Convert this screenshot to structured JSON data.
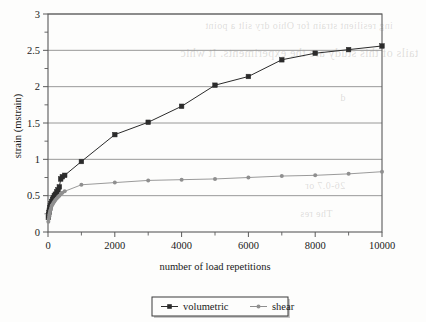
{
  "figure": {
    "background_color": "#fdfdfc",
    "frame_color": "#5a5a5a",
    "grid_color": "#8d8d8d"
  },
  "bleed_through_artifact": {
    "visible": true,
    "lines": [
      "ing resilient strain for Ohio dry silt a point",
      "tails of this study are the experiments. It whic",
      "d",
      "26-0.7 or",
      "The res"
    ]
  },
  "chart_data": {
    "type": "line",
    "title": "",
    "subtitle": "",
    "xlabel": "number of load repetitions",
    "ylabel": "strain (mstrain)",
    "xlim": [
      0,
      10000
    ],
    "ylim": [
      0,
      3
    ],
    "x_major_ticks": [
      0,
      2000,
      4000,
      6000,
      8000,
      10000
    ],
    "x_minor_ticks": [
      1000,
      3000,
      5000,
      7000,
      9000
    ],
    "x_tick_labels": [
      "0",
      "2000",
      "4000",
      "6000",
      "8000",
      "10000"
    ],
    "y_major_ticks": [
      0,
      0.5,
      1,
      1.5,
      2,
      2.5,
      3
    ],
    "y_minor_ticks": [
      0.25,
      0.75,
      1.25,
      1.75,
      2.25,
      2.75
    ],
    "y_tick_labels": [
      "0",
      "0.5",
      "1",
      "1.5",
      "2",
      "2.5",
      "3"
    ],
    "grid": {
      "horizontal": true,
      "vertical": false
    },
    "legend": {
      "position": "bottom-center",
      "border": true
    },
    "series": [
      {
        "name": "volumetric",
        "color": "#2b2b2b",
        "marker": "square",
        "marker_size": 4.6,
        "points": [
          [
            10,
            0.2
          ],
          [
            20,
            0.24
          ],
          [
            30,
            0.27
          ],
          [
            40,
            0.3
          ],
          [
            55,
            0.33
          ],
          [
            70,
            0.36
          ],
          [
            90,
            0.39
          ],
          [
            110,
            0.42
          ],
          [
            135,
            0.45
          ],
          [
            160,
            0.47
          ],
          [
            190,
            0.5
          ],
          [
            220,
            0.52
          ],
          [
            260,
            0.55
          ],
          [
            300,
            0.58
          ],
          [
            340,
            0.62
          ],
          [
            380,
            0.73
          ],
          [
            430,
            0.76
          ],
          [
            500,
            0.78
          ],
          [
            1000,
            0.97
          ],
          [
            2000,
            1.34
          ],
          [
            3000,
            1.51
          ],
          [
            4000,
            1.73
          ],
          [
            5000,
            2.02
          ],
          [
            6000,
            2.14
          ],
          [
            7000,
            2.37
          ],
          [
            8000,
            2.46
          ],
          [
            9000,
            2.51
          ],
          [
            10000,
            2.56
          ]
        ]
      },
      {
        "name": "shear",
        "color": "#8f8f8f",
        "marker": "circle",
        "marker_size": 3.0,
        "points": [
          [
            10,
            0.14
          ],
          [
            20,
            0.18
          ],
          [
            30,
            0.21
          ],
          [
            40,
            0.24
          ],
          [
            55,
            0.27
          ],
          [
            70,
            0.3
          ],
          [
            90,
            0.33
          ],
          [
            110,
            0.36
          ],
          [
            135,
            0.38
          ],
          [
            160,
            0.4
          ],
          [
            190,
            0.42
          ],
          [
            220,
            0.44
          ],
          [
            260,
            0.46
          ],
          [
            300,
            0.48
          ],
          [
            340,
            0.5
          ],
          [
            380,
            0.52
          ],
          [
            430,
            0.54
          ],
          [
            500,
            0.56
          ],
          [
            1000,
            0.65
          ],
          [
            2000,
            0.68
          ],
          [
            3000,
            0.71
          ],
          [
            4000,
            0.72
          ],
          [
            5000,
            0.73
          ],
          [
            6000,
            0.75
          ],
          [
            7000,
            0.77
          ],
          [
            8000,
            0.78
          ],
          [
            9000,
            0.8
          ],
          [
            10000,
            0.83
          ]
        ]
      }
    ]
  }
}
